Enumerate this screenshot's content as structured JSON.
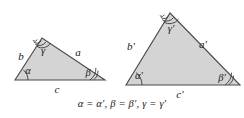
{
  "figure": {
    "type": "geometry-diagram",
    "caption": "α = α′, β = β′, γ = γ′",
    "colors": {
      "fill": "#d4d4d4",
      "stroke": "#4a4a4a",
      "text": "#1a1a1a",
      "background": "#ffffff"
    },
    "triangles": [
      {
        "id": "triangle-left",
        "name": "small-triangle",
        "vertices": {
          "bottom_left": [
            15,
            80
          ],
          "bottom_right": [
            105,
            80
          ],
          "apex": [
            42,
            38
          ]
        },
        "sides": [
          {
            "name": "side-b",
            "label": "b",
            "position": "left",
            "x": 21,
            "y": 60
          },
          {
            "name": "side-a",
            "label": "a",
            "position": "right",
            "x": 78,
            "y": 56
          },
          {
            "name": "side-c",
            "label": "c",
            "position": "base",
            "x": 57,
            "y": 93
          }
        ],
        "angles": [
          {
            "name": "angle-alpha",
            "label": "α",
            "vertex": "bottom_left",
            "arcs": 1,
            "x": 28,
            "y": 74
          },
          {
            "name": "angle-beta",
            "label": "β",
            "vertex": "bottom_right",
            "arcs": 2,
            "x": 88,
            "y": 76
          },
          {
            "name": "angle-gamma",
            "label": "γ",
            "vertex": "apex",
            "arcs": 3,
            "x": 43,
            "y": 54
          }
        ]
      },
      {
        "id": "triangle-right",
        "name": "large-triangle",
        "vertices": {
          "bottom_left": [
            126,
            85
          ],
          "bottom_right": [
            240,
            85
          ],
          "apex": [
            170,
            13
          ]
        },
        "sides": [
          {
            "name": "side-b-prime",
            "label": "b′",
            "position": "left",
            "x": 131,
            "y": 50
          },
          {
            "name": "side-a-prime",
            "label": "a′",
            "position": "right",
            "x": 203,
            "y": 48
          },
          {
            "name": "side-c-prime",
            "label": "c′",
            "position": "base",
            "x": 180,
            "y": 98
          }
        ],
        "angles": [
          {
            "name": "angle-alpha-prime",
            "label": "α′",
            "vertex": "bottom_left",
            "arcs": 1,
            "x": 139,
            "y": 79
          },
          {
            "name": "angle-beta-prime",
            "label": "β′",
            "vertex": "bottom_right",
            "arcs": 2,
            "x": 222,
            "y": 81
          },
          {
            "name": "angle-gamma-prime",
            "label": "γ′",
            "vertex": "apex",
            "arcs": 3,
            "x": 171,
            "y": 32
          }
        ]
      }
    ],
    "equalities": [
      {
        "left": "α",
        "right": "α′"
      },
      {
        "left": "β",
        "right": "β′"
      },
      {
        "left": "γ",
        "right": "γ′"
      }
    ]
  }
}
